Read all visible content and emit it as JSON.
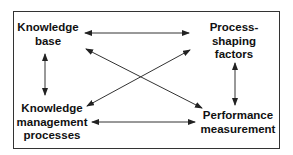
{
  "diagram": {
    "type": "relationship-diagram",
    "stroke_color": "#333333",
    "text_color": "#111111",
    "nodes": [
      {
        "id": "knowledge-base",
        "label": "Knowledge\nbase"
      },
      {
        "id": "process-shaping-factors",
        "label": "Process-\nshaping\nfactors"
      },
      {
        "id": "knowledge-management-processes",
        "label": "Knowledge\nmanagement\nprocesses"
      },
      {
        "id": "performance-measurement",
        "label": "Performance\nmeasurement"
      }
    ],
    "edges": [
      {
        "from": "knowledge-base",
        "to": "process-shaping-factors",
        "bidirectional": true
      },
      {
        "from": "knowledge-base",
        "to": "knowledge-management-processes",
        "bidirectional": true
      },
      {
        "from": "knowledge-base",
        "to": "performance-measurement",
        "bidirectional": true
      },
      {
        "from": "knowledge-management-processes",
        "to": "process-shaping-factors",
        "bidirectional": true
      },
      {
        "from": "process-shaping-factors",
        "to": "performance-measurement",
        "bidirectional": true
      },
      {
        "from": "knowledge-management-processes",
        "to": "performance-measurement",
        "bidirectional": true
      }
    ]
  }
}
